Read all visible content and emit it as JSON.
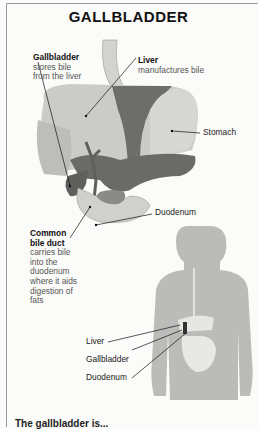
{
  "title": "GALLBLADDER",
  "colors": {
    "organ_light": "#c7c7c4",
    "organ_dark": "#6a6a68",
    "silhouette": "#b9b9b7",
    "line": "#111111",
    "background": "#fbfbf9"
  },
  "main_labels": {
    "gallbladder": {
      "name": "Gallbladder",
      "desc": [
        "stores bile",
        "from the liver"
      ]
    },
    "liver": {
      "name": "Liver",
      "desc": [
        "manufactures bile"
      ]
    },
    "stomach": {
      "name": "Stomach"
    },
    "duodenum": {
      "name": "Duodenum"
    },
    "common_bile_duct": {
      "name": [
        "Common",
        "bile duct"
      ],
      "desc": [
        "carries bile",
        "into the",
        "duodenum",
        "where it aids",
        "digestion of",
        "fats"
      ]
    }
  },
  "body_labels": [
    "Liver",
    "Gallbladder",
    "Duodenum"
  ],
  "footer": "The gallbladder is..."
}
